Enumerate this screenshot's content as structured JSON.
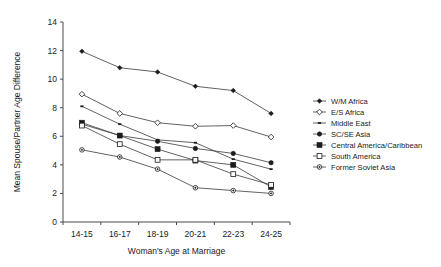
{
  "chart_data": {
    "type": "line",
    "title": "",
    "xlabel": "Woman's Age at Marriage",
    "ylabel": "Mean Spouse/Partner Age Difference",
    "categories": [
      "14-15",
      "16-17",
      "18-19",
      "20-21",
      "22-23",
      "24-25"
    ],
    "ylim": [
      0,
      14
    ],
    "yticks": [
      0,
      2,
      4,
      6,
      8,
      10,
      12,
      14
    ],
    "grid": false,
    "legend_position": "right",
    "series": [
      {
        "name": "W/M Africa",
        "marker": "filled-diamond",
        "values": [
          11.95,
          10.8,
          10.5,
          9.5,
          9.2,
          7.6
        ]
      },
      {
        "name": "E/S Africa",
        "marker": "open-diamond",
        "values": [
          8.95,
          7.6,
          6.95,
          6.7,
          6.75,
          5.95
        ]
      },
      {
        "name": "Middle East",
        "marker": "small-dash",
        "values": [
          8.1,
          6.85,
          5.75,
          5.55,
          4.4,
          3.7
        ]
      },
      {
        "name": "SC/SE Asia",
        "marker": "filled-circle",
        "values": [
          6.85,
          6.05,
          5.65,
          5.15,
          4.8,
          4.15
        ]
      },
      {
        "name": "Central America/Caribbean",
        "marker": "filled-square",
        "values": [
          6.95,
          6.05,
          5.1,
          4.3,
          4.0,
          2.45
        ]
      },
      {
        "name": "South America",
        "marker": "open-square",
        "values": [
          6.75,
          5.45,
          4.35,
          4.35,
          3.35,
          2.6
        ]
      },
      {
        "name": "Former Soviet Asia",
        "marker": "open-circle",
        "values": [
          5.05,
          4.55,
          3.7,
          2.4,
          2.2,
          2.0
        ]
      }
    ]
  },
  "legend": {
    "items": [
      {
        "label": "W/M Africa"
      },
      {
        "label": "E/S Africa"
      },
      {
        "label": "Middle East"
      },
      {
        "label": "SC/SE Asia"
      },
      {
        "label": "Central America/Caribbean"
      },
      {
        "label": "South America"
      },
      {
        "label": "Former Soviet Asia"
      }
    ]
  },
  "axes": {
    "x_title": "Woman's Age at Marriage",
    "y_title": "Mean Spouse/Partner Age Difference",
    "x_labels": [
      "14-15",
      "16-17",
      "18-19",
      "20-21",
      "22-23",
      "24-25"
    ],
    "y_labels": [
      "0",
      "2",
      "4",
      "6",
      "8",
      "10",
      "12",
      "14"
    ]
  },
  "colors": {
    "ink": "#1c1c1c",
    "axis": "#4a4a4a",
    "background": "#ffffff"
  }
}
